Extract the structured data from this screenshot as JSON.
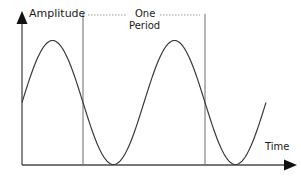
{
  "diagram": {
    "y_axis_label": "Amplitude",
    "x_axis_label": "Time",
    "period_label_line1": "One",
    "period_label_line2": "Period",
    "colors": {
      "axis": "#4a4a4a",
      "curve": "#3a3a3a",
      "marker_lines": "#6a6a6a",
      "dotted": "#9a9a9a",
      "arrowhead": "#111111"
    }
  },
  "chart_data": {
    "type": "line",
    "title": "",
    "xlabel": "Time",
    "ylabel": "Amplitude",
    "series": [
      {
        "name": "sine wave",
        "function": "sin",
        "cycles_shown": 2.0,
        "phase_start": 0,
        "note": "starts at midline rising, ends at midline rising"
      }
    ],
    "annotations": [
      {
        "type": "period_marker",
        "text": "One Period",
        "from_phase": 0.5,
        "to_phase": 1.5,
        "unit": "cycles"
      }
    ],
    "grid": false,
    "ticks": false
  }
}
